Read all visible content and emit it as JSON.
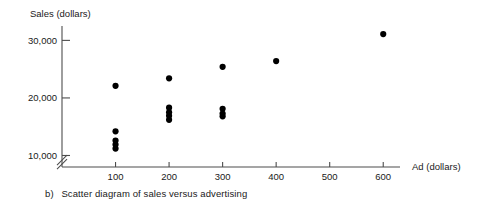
{
  "caption": {
    "label": "b)",
    "text": "Scatter diagram of sales versus advertising"
  },
  "chart_data": {
    "type": "scatter",
    "title": "",
    "subtitle": "",
    "xlabel": "Ad (dollars)",
    "ylabel": "Sales (dollars)",
    "xticks": [
      100,
      200,
      300,
      400,
      500,
      600
    ],
    "xtick_labels": [
      "100",
      "200",
      "300",
      "400",
      "500",
      "600"
    ],
    "yticks": [
      10000,
      20000,
      30000
    ],
    "ytick_labels": [
      "10,000",
      "20,000",
      "30,000"
    ],
    "xlim": [
      0,
      650
    ],
    "ylim": [
      8000,
      32500
    ],
    "grid": false,
    "legend": null,
    "y_axis_break": true,
    "marker": "filled-circle",
    "marker_color": "#000000",
    "points": [
      {
        "x": 100,
        "y": 22100
      },
      {
        "x": 100,
        "y": 14200
      },
      {
        "x": 100,
        "y": 12600
      },
      {
        "x": 100,
        "y": 11900
      },
      {
        "x": 100,
        "y": 11200
      },
      {
        "x": 200,
        "y": 23400
      },
      {
        "x": 200,
        "y": 18300
      },
      {
        "x": 200,
        "y": 17500
      },
      {
        "x": 200,
        "y": 16900
      },
      {
        "x": 200,
        "y": 16200
      },
      {
        "x": 300,
        "y": 25400
      },
      {
        "x": 300,
        "y": 18100
      },
      {
        "x": 300,
        "y": 17300
      },
      {
        "x": 300,
        "y": 16800
      },
      {
        "x": 400,
        "y": 26400
      },
      {
        "x": 600,
        "y": 31100
      }
    ]
  }
}
